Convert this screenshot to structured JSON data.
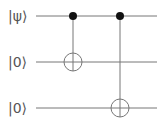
{
  "diagram": {
    "type": "quantum-circuit",
    "qubits": [
      {
        "label": "|ψ⟩",
        "y": 16
      },
      {
        "label": "|0⟩",
        "y": 62
      },
      {
        "label": "|0⟩",
        "y": 108
      }
    ],
    "gates": [
      {
        "type": "CNOT",
        "control": 0,
        "target": 1,
        "x": 73
      },
      {
        "type": "CNOT",
        "control": 0,
        "target": 2,
        "x": 120
      }
    ],
    "colors": {
      "line": "#666666",
      "dot": "#111111",
      "text": "#555555"
    }
  }
}
